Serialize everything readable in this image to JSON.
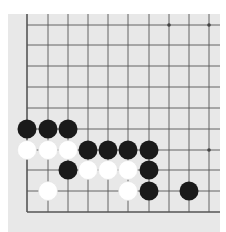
{
  "board": {
    "background_color": "#e8e8e8",
    "line_color": "#555555",
    "x_lines": [
      27,
      48,
      68,
      88,
      108,
      128,
      149,
      169,
      189,
      209
    ],
    "y_lines": [
      25,
      45,
      66,
      87,
      108,
      129,
      150,
      170,
      191,
      212
    ],
    "edges": {
      "left": true,
      "bottom": true,
      "top": false,
      "right": false
    },
    "star_points": [
      [
        7,
        0
      ],
      [
        9,
        0
      ],
      [
        9,
        6
      ]
    ],
    "stone_radius": 9.5,
    "stones": [
      {
        "color": "black",
        "col": 0,
        "row": 5
      },
      {
        "color": "black",
        "col": 1,
        "row": 5
      },
      {
        "color": "black",
        "col": 2,
        "row": 5
      },
      {
        "color": "white",
        "col": 0,
        "row": 6
      },
      {
        "color": "white",
        "col": 1,
        "row": 6
      },
      {
        "color": "white",
        "col": 2,
        "row": 6
      },
      {
        "color": "black",
        "col": 3,
        "row": 6
      },
      {
        "color": "black",
        "col": 4,
        "row": 6
      },
      {
        "color": "black",
        "col": 5,
        "row": 6
      },
      {
        "color": "black",
        "col": 6,
        "row": 6
      },
      {
        "color": "black",
        "col": 2,
        "row": 7
      },
      {
        "color": "white",
        "col": 3,
        "row": 7
      },
      {
        "color": "white",
        "col": 4,
        "row": 7
      },
      {
        "color": "white",
        "col": 5,
        "row": 7
      },
      {
        "color": "black",
        "col": 6,
        "row": 7
      },
      {
        "color": "white",
        "col": 1,
        "row": 8
      },
      {
        "color": "white",
        "col": 5,
        "row": 8
      },
      {
        "color": "black",
        "col": 6,
        "row": 8
      },
      {
        "color": "black",
        "col": 8,
        "row": 8
      }
    ]
  }
}
